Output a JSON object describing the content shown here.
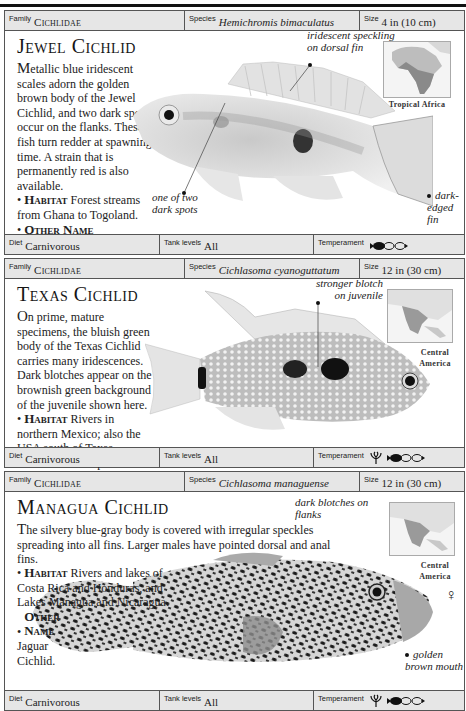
{
  "entries": [
    {
      "family_label": "Family",
      "family": "Cichlidae",
      "species_label": "Species",
      "species": "Hemichromis bimaculatus",
      "size_label": "Size",
      "size": "4 in (10 cm)",
      "title": "Jewel Cichlid",
      "description": {
        "dropcap": "M",
        "body": "etallic blue iridescent scales adorn the golden brown body of the Jewel Cichlid, and two dark spots occur on the flanks. These fish turn redder at spawning time. A strain that is permanently red is also available.",
        "facts": [
          {
            "key": "Habitat",
            "text": "Forest streams from Ghana to Togoland."
          },
          {
            "key": "Other Name",
            "text": "Hemichromis guttatus.",
            "italic": true
          }
        ]
      },
      "annotations": [
        {
          "text": "iridescent speckling on dorsal fin"
        },
        {
          "text": "one of two dark spots"
        },
        {
          "text": "dark-edged fin"
        }
      ],
      "region": "Tropical Africa",
      "map": "africa-map",
      "diet_label": "Diet",
      "diet": "Carnivorous",
      "tank_label": "Tank levels",
      "tank": "All",
      "temperament_label": "Temperament",
      "temperament_icons": [
        "community-fish-icon"
      ]
    },
    {
      "family_label": "Family",
      "family": "Cichlidae",
      "species_label": "Species",
      "species": "Cichlasoma cyanoguttatum",
      "size_label": "Size",
      "size": "12 in (30 cm)",
      "title": "Texas Cichlid",
      "description": {
        "dropcap": "O",
        "body": "n prime, mature specimens, the bluish green body of the Texas Cichlid carries many iridescences. Dark blotches appear on the brownish green background of the juvenile shown here.",
        "facts": [
          {
            "key": "Habitat",
            "text": "Rivers in northern Mexico; also the USA south of Texas."
          },
          {
            "key": "Remark",
            "text": "The species",
            "italic_tail": "Cichlasoma carpinte",
            "tail": " is similar."
          }
        ]
      },
      "annotations": [
        {
          "text": "stronger blotch on juvenile"
        }
      ],
      "region": "Central America",
      "map": "central-america-map",
      "diet_label": "Diet",
      "diet": "Carnivorous",
      "tank_label": "Tank levels",
      "tank": "All",
      "temperament_label": "Temperament",
      "temperament_icons": [
        "plant-icon",
        "community-fish-icon"
      ]
    },
    {
      "family_label": "Family",
      "family": "Cichlidae",
      "species_label": "Species",
      "species": "Cichlasoma managuense",
      "size_label": "Size",
      "size": "12 in (30 cm)",
      "title": "Managua Cichlid",
      "description": {
        "dropcap": "T",
        "body": "he silvery blue-gray body is covered with irregular speckles spreading into all fins. Larger males have pointed dorsal and anal fins.",
        "facts": [
          {
            "key": "Habitat",
            "text": "Rivers and lakes of Costa Rica and Honduras, and Lakes Managua and Nicaragua."
          },
          {
            "key": "Other Name",
            "text": "Jaguar Cichlid."
          }
        ]
      },
      "annotations": [
        {
          "text": "dark blotches on flanks"
        },
        {
          "text": "golden brown mouth"
        }
      ],
      "region": "Central America",
      "sex_symbol": "♀",
      "map": "central-america-map",
      "diet_label": "Diet",
      "diet": "Carnivorous",
      "tank_label": "Tank levels",
      "tank": "All",
      "temperament_label": "Temperament",
      "temperament_icons": [
        "plant-icon",
        "community-fish-icon"
      ]
    }
  ]
}
